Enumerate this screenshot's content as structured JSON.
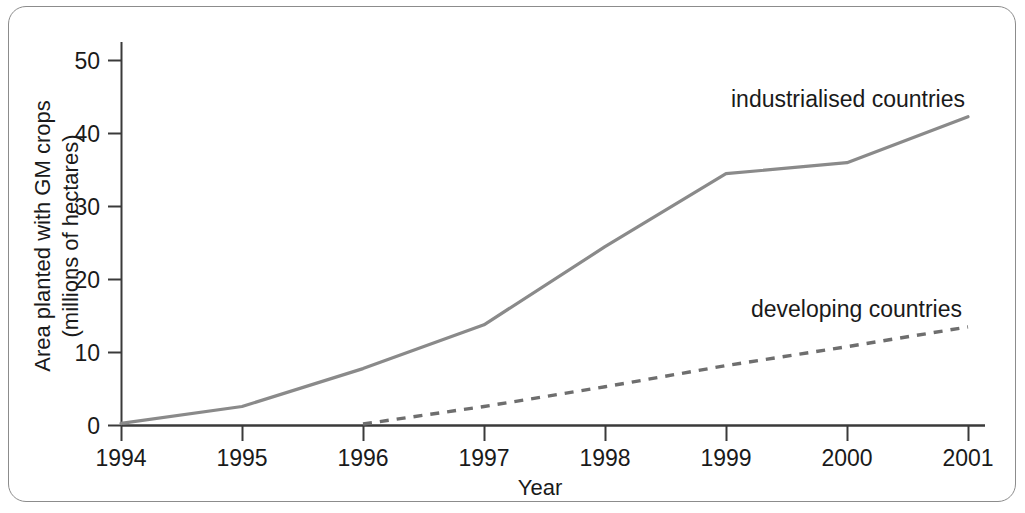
{
  "chart_data": {
    "type": "line",
    "title": "",
    "xlabel": "Year",
    "ylabel": "Area planted with GM crops (millions of hectares)",
    "ylabel_line1": "Area planted with GM crops",
    "ylabel_line2": "(millions of hectares)",
    "x": [
      1994,
      1995,
      1996,
      1997,
      1998,
      1999,
      2000,
      2001
    ],
    "xticklabels": [
      "1994",
      "1995",
      "1996",
      "1997",
      "1998",
      "1999",
      "2000",
      "2001"
    ],
    "yticks": [
      0,
      10,
      20,
      30,
      40,
      50
    ],
    "yticklabels": [
      "0",
      "10",
      "20",
      "30",
      "40",
      "50"
    ],
    "xlim": [
      1994,
      2001
    ],
    "ylim": [
      0,
      52
    ],
    "grid": false,
    "legend_position": "inline-annotation",
    "series": [
      {
        "name": "industrialised countries",
        "label": "industrialised countries",
        "linestyle": "solid",
        "color": "#8a8a8a",
        "x": [
          1994,
          1995,
          1996,
          1997,
          1998,
          1999,
          2000,
          2001
        ],
        "values": [
          0.3,
          2.6,
          7.8,
          13.8,
          24.5,
          34.5,
          36.0,
          42.3
        ]
      },
      {
        "name": "developing countries",
        "label": "developing countries",
        "linestyle": "dashed",
        "color": "#6e6e6e",
        "x": [
          1996,
          1997,
          1998,
          1999,
          2000,
          2001
        ],
        "values": [
          0.2,
          2.6,
          5.3,
          8.2,
          10.8,
          13.5
        ]
      }
    ],
    "annotations": [
      {
        "text": "industrialised countries",
        "x": 2000.1,
        "y": 45.5
      },
      {
        "text": "developing countries",
        "x": 1999.9,
        "y": 17.0
      }
    ]
  }
}
